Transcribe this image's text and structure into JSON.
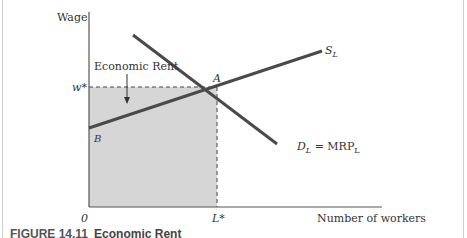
{
  "diagram": {
    "type": "labor-market-economic-rent",
    "y_axis_label": "Wage",
    "x_axis_label": "Number of workers",
    "origin_label": "0",
    "wage_label": "w*",
    "quantity_label": "L*",
    "shaded_region_label": "Economic Rent",
    "supply_curve": {
      "label": "S",
      "subscript": "L"
    },
    "demand_curve": {
      "label": "D",
      "subscript": "L",
      "equals": " = MRP",
      "equals_subscript": "L"
    },
    "point_equilibrium": "A",
    "point_intercept": "B",
    "colors": {
      "curve": "#4a4a4a",
      "axis": "#555555",
      "shade": "#d6d6d6",
      "text": "#333333"
    }
  },
  "caption": {
    "number": "FIGURE 14.11",
    "title": "Economic Rent"
  }
}
